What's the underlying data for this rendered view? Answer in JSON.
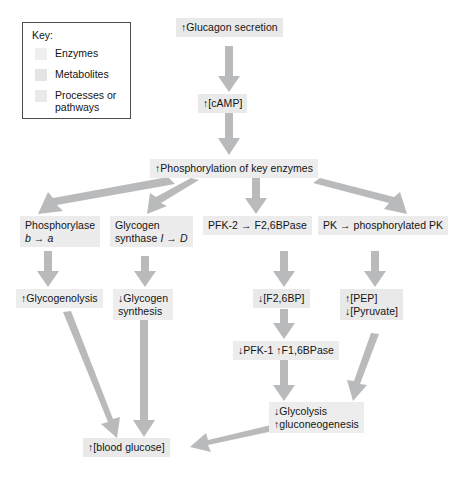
{
  "diagram": {
    "arrow_color": "#b8b9ba",
    "box_color": "#ececed",
    "key": {
      "title": "Key:",
      "items": [
        {
          "label": "Enzymes",
          "swatch": "#efefef"
        },
        {
          "label": "Metabolites",
          "swatch": "#e4e4e5"
        },
        {
          "label": "Processes\nor pathways",
          "label_line1": "Processes",
          "label_line2": "or pathways",
          "swatch": "#e9e9ea"
        }
      ]
    },
    "nodes": {
      "glucagon": {
        "text": "↑Glucagon secretion",
        "type": "metabolite"
      },
      "camp": {
        "text": "↑[cAMP]",
        "type": "metabolite"
      },
      "phosphorylation": {
        "text": "↑Phosphorylation of key enzymes",
        "type": "process"
      },
      "phosphorylase": {
        "line1": "Phosphorylase",
        "line2_a": "b",
        "line2_arrow": " → ",
        "line2_b": "a",
        "type": "enzyme"
      },
      "glycogen_synthase": {
        "line1": "Glycogen",
        "line2_a": "synthase ",
        "line2_i": "I",
        "line2_arrow": " → ",
        "line2_d": "D",
        "type": "enzyme"
      },
      "pfk2": {
        "text": "PFK-2 → F2,6BPase",
        "type": "enzyme"
      },
      "pk": {
        "text": "PK → phosphorylated PK",
        "type": "enzyme"
      },
      "glycogenolysis": {
        "text": "↑Glycogenolysis",
        "type": "process"
      },
      "glycogen_synthesis": {
        "line1": "↓Glycogen",
        "line2": "synthesis",
        "type": "process"
      },
      "f26bp": {
        "text": "↓[F2,6BP]",
        "type": "metabolite"
      },
      "pep_pyruvate": {
        "line1": "↑[PEP]",
        "line2": "↓[Pyruvate]",
        "type": "metabolite"
      },
      "pfk1": {
        "text": "↓PFK-1 ↑F1,6BPase",
        "type": "enzyme"
      },
      "glycolysis": {
        "line1": "↓Glycolysis",
        "line2": "↑gluconeogenesis",
        "type": "process"
      },
      "blood_glucose": {
        "text": "↑[blood glucose]",
        "type": "metabolite"
      }
    }
  }
}
